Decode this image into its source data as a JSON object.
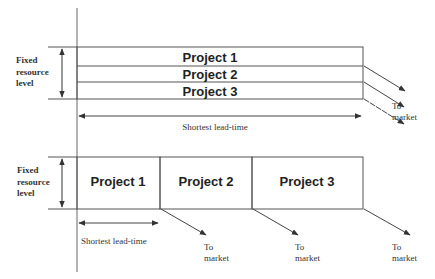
{
  "colors": {
    "line": "#555555",
    "text": "#333333",
    "background": "#ffffff"
  },
  "top_section": {
    "axis_label": [
      "Fixed",
      "resource",
      "level"
    ],
    "projects": [
      {
        "label": "Project 1"
      },
      {
        "label": "Project 2"
      },
      {
        "label": "Project 3"
      }
    ],
    "lead_time_label": "Shortest lead-time",
    "to_market_label": [
      "To",
      "market"
    ]
  },
  "bottom_section": {
    "axis_label": [
      "Fixed",
      "resource",
      "level"
    ],
    "projects": [
      {
        "label": "Project 1",
        "to_market": [
          "To",
          "market"
        ]
      },
      {
        "label": "Project 2",
        "to_market": [
          "To",
          "market"
        ]
      },
      {
        "label": "Project 3",
        "to_market": [
          "To",
          "market"
        ]
      }
    ],
    "lead_time_label": "Shortest lead-time"
  }
}
